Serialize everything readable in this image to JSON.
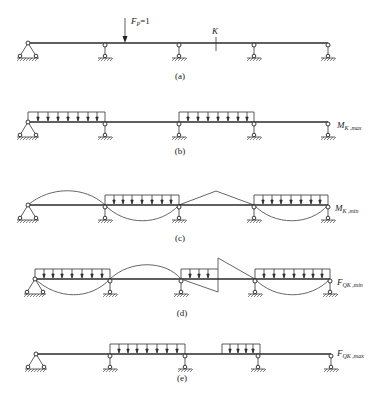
{
  "figure": {
    "supports_x": [
      28,
      105,
      179,
      254,
      328
    ],
    "panels": [
      {
        "id": "a",
        "caption": "(a)",
        "beam_y": 43,
        "load": {
          "label_main": "F",
          "label_sub": "P",
          "label_suffix": "=1",
          "x": 125
        },
        "section_label": "K",
        "section_x": 216
      },
      {
        "id": "b",
        "caption": "(b)",
        "beam_y": 122,
        "udl_spans": [
          [
            28,
            105
          ],
          [
            179,
            254
          ]
        ],
        "result_label": {
          "main": "M",
          "sub": "K ,max"
        }
      },
      {
        "id": "c",
        "caption": "(c)",
        "beam_y": 205,
        "udl_spans": [
          [
            105,
            179
          ],
          [
            254,
            328
          ]
        ],
        "result_label": {
          "main": "M",
          "sub": "K ,min"
        }
      },
      {
        "id": "d",
        "caption": "(d)",
        "beam_y": 279,
        "udl_spans": [
          [
            35,
            110
          ],
          [
            181,
            218
          ],
          [
            255,
            330
          ]
        ],
        "result_label": {
          "main": "F",
          "sub": "QK ,min"
        }
      },
      {
        "id": "e",
        "caption": "(e)",
        "beam_y": 354,
        "udl_spans": [
          [
            110,
            185
          ],
          [
            222,
            260
          ]
        ],
        "result_label": {
          "main": "F",
          "sub": "QK ,max"
        }
      }
    ]
  }
}
